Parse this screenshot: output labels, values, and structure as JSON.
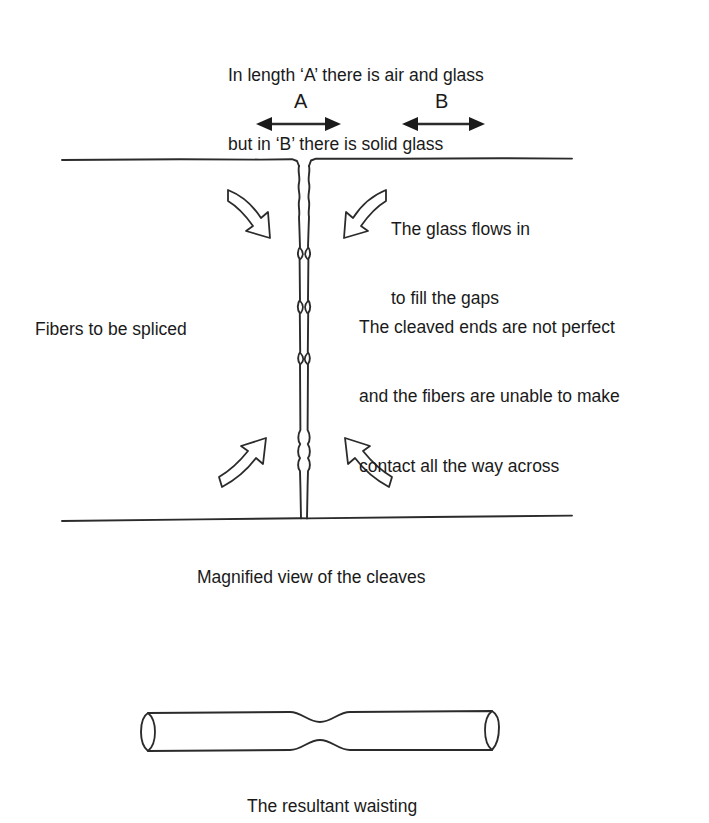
{
  "diagram": {
    "header_note": {
      "line1": "In length ‘A’ there is air and glass",
      "line2": "but in ‘B’ there is solid glass"
    },
    "span_labels": {
      "a": "A",
      "b": "B"
    },
    "annotations": {
      "glass_flows": {
        "line1": "The glass flows in",
        "line2": "to fill the gaps"
      },
      "cleaved_ends": {
        "line1": "The cleaved ends are not perfect",
        "line2": "and the fibers are unable to make",
        "line3": "contact all the way across"
      },
      "fibers_to_be_spliced": "Fibers to be spliced"
    },
    "captions": {
      "magnified_view": "Magnified view of the cleaves",
      "resultant_waisting": "The resultant waisting"
    },
    "colors": {
      "ink": "#1a1a1a",
      "line": "#2b2b2b",
      "background": "#ffffff"
    }
  }
}
